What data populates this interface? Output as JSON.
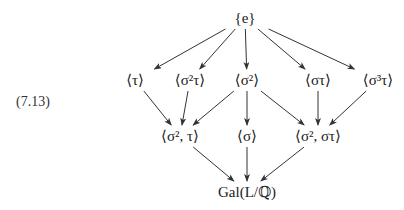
{
  "equation_number": "(7.13)",
  "colors": {
    "text": "#222222",
    "arrow": "#333333",
    "background": "#ffffff"
  },
  "nodes": [
    {
      "id": "e",
      "label": "{e}",
      "x": 245,
      "y": 18
    },
    {
      "id": "tau",
      "label": "⟨τ⟩",
      "x": 135,
      "y": 80
    },
    {
      "id": "s2tau",
      "label": "⟨σ²τ⟩",
      "x": 190,
      "y": 80
    },
    {
      "id": "s2",
      "label": "⟨σ²⟩",
      "x": 247,
      "y": 80
    },
    {
      "id": "stau",
      "label": "⟨στ⟩",
      "x": 318,
      "y": 80
    },
    {
      "id": "s3tau",
      "label": "⟨σ³τ⟩",
      "x": 378,
      "y": 80
    },
    {
      "id": "s2_tau",
      "label": "⟨σ², τ⟩",
      "x": 180,
      "y": 136
    },
    {
      "id": "s",
      "label": "⟨σ⟩",
      "x": 247,
      "y": 136
    },
    {
      "id": "s2_stau",
      "label": "⟨σ², στ⟩",
      "x": 318,
      "y": 136
    },
    {
      "id": "gal",
      "label": "Gal(L/ℚ)",
      "x": 247,
      "y": 192
    }
  ],
  "edges": [
    {
      "from": "e",
      "to": "tau"
    },
    {
      "from": "e",
      "to": "s2tau"
    },
    {
      "from": "e",
      "to": "s2"
    },
    {
      "from": "e",
      "to": "stau"
    },
    {
      "from": "e",
      "to": "s3tau"
    },
    {
      "from": "tau",
      "to": "s2_tau"
    },
    {
      "from": "s2tau",
      "to": "s2_tau"
    },
    {
      "from": "s2",
      "to": "s2_tau"
    },
    {
      "from": "s2",
      "to": "s"
    },
    {
      "from": "s2",
      "to": "s2_stau"
    },
    {
      "from": "stau",
      "to": "s2_stau"
    },
    {
      "from": "s3tau",
      "to": "s2_stau"
    },
    {
      "from": "s2_tau",
      "to": "gal"
    },
    {
      "from": "s",
      "to": "gal"
    },
    {
      "from": "s2_stau",
      "to": "gal"
    }
  ]
}
